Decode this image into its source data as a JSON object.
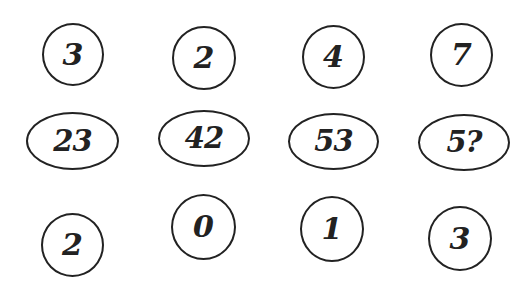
{
  "puzzle": {
    "top_row": [
      {
        "value": "3",
        "cx": 72,
        "cy": 54
      },
      {
        "value": "2",
        "cx": 204,
        "cy": 58
      },
      {
        "value": "4",
        "cx": 333,
        "cy": 57
      },
      {
        "value": "7",
        "cx": 461,
        "cy": 55
      }
    ],
    "middle_row": [
      {
        "value": "23",
        "cx": 72,
        "cy": 141
      },
      {
        "value": "42",
        "cx": 204,
        "cy": 138
      },
      {
        "value": "53",
        "cx": 333,
        "cy": 141
      },
      {
        "value": "5?",
        "cx": 465,
        "cy": 141
      }
    ],
    "bottom_row": [
      {
        "value": "2",
        "cx": 72,
        "cy": 244
      },
      {
        "value": "0",
        "cx": 204,
        "cy": 227
      },
      {
        "value": "1",
        "cx": 333,
        "cy": 229
      },
      {
        "value": "3",
        "cx": 461,
        "cy": 239
      }
    ]
  },
  "colors": {
    "stroke": "#222222",
    "background": "#ffffff"
  }
}
